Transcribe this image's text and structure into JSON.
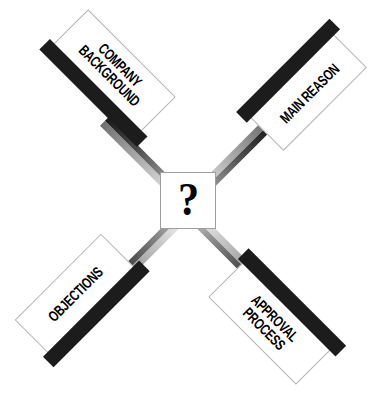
{
  "diagram": {
    "type": "radial-four-arm",
    "title": "",
    "background_color": "#ffffff",
    "hub": {
      "symbol": "?",
      "fill_color": "#ffffff",
      "border_color": "#9e9e9e",
      "symbol_color": "#000000"
    },
    "style": {
      "panel_fill": "#ffffff",
      "panel_border": "#b5b5b5",
      "accent_bar_color": "#1c1c1c",
      "shaft_light": "#d8d8d8",
      "shaft_dark": "#1a1a1a",
      "label_color": "#000000"
    },
    "arms": [
      {
        "id": "company-background",
        "label": "COMPANY\nBACKGROUND",
        "position": "top-left",
        "rotation_deg": 45,
        "bar_edge": "bottom"
      },
      {
        "id": "main-reason",
        "label": "MAIN REASON",
        "position": "top-right",
        "rotation_deg": -45,
        "bar_edge": "top"
      },
      {
        "id": "objections",
        "label": "OBJECTIONS",
        "position": "bottom-left",
        "rotation_deg": -45,
        "bar_edge": "bottom"
      },
      {
        "id": "approval-process",
        "label": "APPROVAL\nPROCESS",
        "position": "bottom-right",
        "rotation_deg": 45,
        "bar_edge": "top"
      }
    ]
  }
}
